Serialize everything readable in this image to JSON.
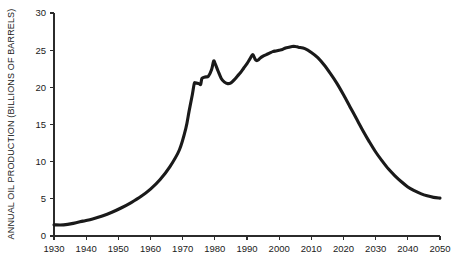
{
  "chart_data": {
    "type": "line",
    "title": "",
    "subtitle": "",
    "xlabel": "",
    "ylabel": "ANNUAL OIL PRODUCTION (BILLIONS OF BARRELS)",
    "xlim": [
      1930,
      2050
    ],
    "ylim": [
      0,
      30
    ],
    "grid": false,
    "legend": "none",
    "x_ticks": [
      1930,
      1940,
      1950,
      1960,
      1970,
      1980,
      1990,
      2000,
      2010,
      2020,
      2030,
      2040,
      2050
    ],
    "x_tick_labels": [
      "1930",
      "1940",
      "1950",
      "1960",
      "1970",
      "1980",
      "1990",
      "2000",
      "2010",
      "2020",
      "2030",
      "2040",
      "2050"
    ],
    "y_ticks": [
      0,
      5,
      10,
      15,
      20,
      25,
      30
    ],
    "y_tick_labels": [
      "0",
      "5",
      "10",
      "15",
      "20",
      "25",
      "30"
    ],
    "series": [
      {
        "name": "Annual oil production",
        "color": "#1a1a1a",
        "x": [
          1930,
          1933,
          1936,
          1939,
          1942,
          1945,
          1948,
          1951,
          1954,
          1957,
          1960,
          1963,
          1966,
          1969,
          1971,
          1972,
          1973,
          1973.6,
          1974,
          1975,
          1975.6,
          1976,
          1977,
          1978,
          1979,
          1979.6,
          1980,
          1981,
          1982,
          1983,
          1984,
          1985,
          1986,
          1987,
          1988,
          1989,
          1990,
          1991,
          1991.8,
          1992.5,
          1993,
          1993.6,
          1994,
          1995,
          1996,
          1997,
          1998,
          1999,
          2000,
          2001,
          2002,
          2003,
          2004,
          2005,
          2006,
          2008,
          2010,
          2012,
          2014,
          2016,
          2018,
          2020,
          2022,
          2024,
          2026,
          2028,
          2030,
          2032,
          2034,
          2036,
          2038,
          2040,
          2042,
          2044,
          2046,
          2048,
          2050
        ],
        "y": [
          1.5,
          1.5,
          1.7,
          2.0,
          2.3,
          2.7,
          3.2,
          3.8,
          4.5,
          5.3,
          6.3,
          7.6,
          9.3,
          11.6,
          14.5,
          16.8,
          19.0,
          20.5,
          20.6,
          20.5,
          20.4,
          21.2,
          21.4,
          21.5,
          22.4,
          23.5,
          23.3,
          22.2,
          21.2,
          20.7,
          20.5,
          20.6,
          21.0,
          21.5,
          22.0,
          22.6,
          23.2,
          23.9,
          24.4,
          23.8,
          23.6,
          23.7,
          23.9,
          24.2,
          24.4,
          24.6,
          24.8,
          24.9,
          25.0,
          25.1,
          25.3,
          25.4,
          25.5,
          25.5,
          25.4,
          25.2,
          24.7,
          24.0,
          23.0,
          21.8,
          20.5,
          19.0,
          17.4,
          15.8,
          14.2,
          12.7,
          11.3,
          10.1,
          9.0,
          8.1,
          7.3,
          6.6,
          6.1,
          5.7,
          5.4,
          5.2,
          5.1
        ]
      }
    ]
  },
  "plot": {
    "pixels": {
      "left": 54,
      "right": 440,
      "top": 13,
      "bottom": 236
    }
  }
}
